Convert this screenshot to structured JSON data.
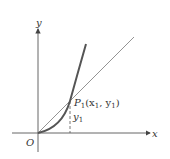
{
  "diagram": {
    "type": "tangent-line-to-curve",
    "axes": {
      "x_label": "x",
      "y_label": "y",
      "origin_label": "O"
    },
    "point": {
      "name": "P",
      "subscript": "1",
      "coords_text": "(x",
      "x_sub": "1",
      "sep": ", y",
      "y_sub": "1",
      "close": ")"
    },
    "ordinate_label": "y",
    "ordinate_sub": "1",
    "colors": {
      "curve": "#555555",
      "line": "#777777",
      "axis": "#444444"
    }
  }
}
